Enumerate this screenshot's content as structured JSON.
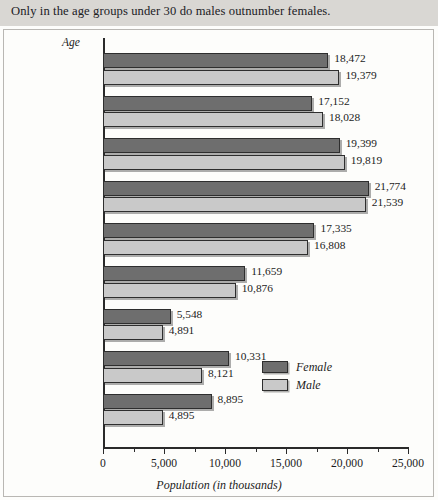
{
  "header": {
    "caption": "Only in the age groups under 30 do males outnumber females."
  },
  "legend": {
    "position": "inside-right",
    "items": [
      {
        "label": "Female",
        "color": "#6e6e6e",
        "swatch": "female-swatch"
      },
      {
        "label": "Male",
        "color": "#c9c9c9",
        "swatch": "male-swatch"
      }
    ]
  },
  "axes": {
    "y_title": "Age",
    "x_title": "Population (in thousands)"
  },
  "chart_data": {
    "type": "bar",
    "orientation": "horizontal",
    "title": "Only in the age groups under 30 do males outnumber females.",
    "xlabel": "Population (in thousands)",
    "ylabel": "Age",
    "xlim": [
      0,
      25000
    ],
    "xticks": [
      0,
      5000,
      10000,
      15000,
      20000,
      25000
    ],
    "xtick_labels": [
      "0",
      "5,000",
      "10,000",
      "15,000",
      "20,000",
      "25,000"
    ],
    "minor_tick_interval": 2500,
    "grid": false,
    "legend_position": "inside-right",
    "categories": [
      "Under 10",
      "10–19",
      "20–29",
      "30–39",
      "40–49",
      "50–59",
      "60–64",
      "65–74",
      "75 and over"
    ],
    "series": [
      {
        "name": "Female",
        "color": "#6e6e6e",
        "values": [
          18472,
          17152,
          19399,
          21774,
          17335,
          11659,
          5548,
          10331,
          8895
        ],
        "labels": [
          "18,472",
          "17,152",
          "19,399",
          "21,774",
          "17,335",
          "11,659",
          "5,548",
          "10,331",
          "8,895"
        ]
      },
      {
        "name": "Male",
        "color": "#c9c9c9",
        "values": [
          19379,
          18028,
          19819,
          21539,
          16808,
          10876,
          4891,
          8121,
          4895
        ],
        "labels": [
          "19,379",
          "18,028",
          "19,819",
          "21,539",
          "16,808",
          "10,876",
          "4,891",
          "8,121",
          "4,895"
        ]
      }
    ]
  }
}
